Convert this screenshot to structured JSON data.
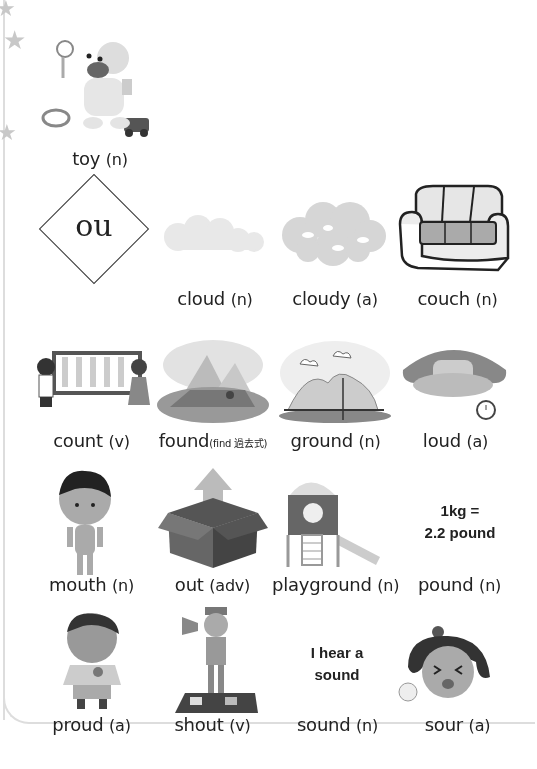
{
  "header_item": {
    "word": "toy",
    "pos": "(n)",
    "image": "baby-with-toys"
  },
  "phonics_unit": {
    "letters": "ou"
  },
  "rows": [
    [
      {
        "word": "cloud",
        "pos": "(n)",
        "image": "cloud"
      },
      {
        "word": "cloudy",
        "pos": "(a)",
        "image": "cloudy-sky"
      },
      {
        "word": "couch",
        "pos": "(n)",
        "image": "couch"
      }
    ],
    [
      {
        "word": "count",
        "pos": "(v)",
        "image": "children-counting-abacus"
      },
      {
        "word": "found",
        "pos": "(find 過去式)",
        "image": "pyramids-explorer"
      },
      {
        "word": "ground",
        "pos": "(n)",
        "image": "ground-hills"
      },
      {
        "word": "loud",
        "pos": "(a)",
        "image": "loud-alarm-clock"
      }
    ],
    [
      {
        "word": "mouth",
        "pos": "(n)",
        "image": "boy"
      },
      {
        "word": "out",
        "pos": "(adv)",
        "image": "box-arrow-out"
      },
      {
        "word": "playground",
        "pos": "(n)",
        "image": "playground-slide"
      },
      {
        "word": "pound",
        "pos": "(n)",
        "image_text_line1": "1kg =",
        "image_text_line2": "2.2 pound"
      }
    ],
    [
      {
        "word": "proud",
        "pos": "(a)",
        "image": "proud-boy-ribbon"
      },
      {
        "word": "shout",
        "pos": "(v)",
        "image": "boy-shouting-megaphone"
      },
      {
        "word": "sound",
        "pos": "(n)",
        "image_text_line1": "I hear a",
        "image_text_line2": "sound"
      },
      {
        "word": "sour",
        "pos": "(a)",
        "image": "girl-sour-lemon"
      }
    ]
  ]
}
